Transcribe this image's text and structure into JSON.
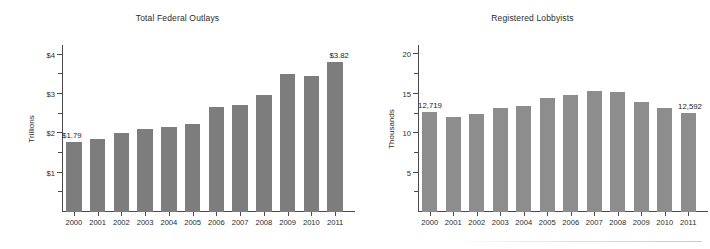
{
  "figure": {
    "background": "#ffffff",
    "panels": [
      "outlays",
      "lobbyists"
    ]
  },
  "chart_data": [
    {
      "id": "outlays",
      "type": "bar",
      "title": "Total Federal Outlays",
      "xlabel": "",
      "ylabel": "Trillions",
      "categories": [
        "2000",
        "2001",
        "2002",
        "2003",
        "2004",
        "2005",
        "2006",
        "2007",
        "2008",
        "2009",
        "2010",
        "2011"
      ],
      "values": [
        1.79,
        1.86,
        2.01,
        2.11,
        2.16,
        2.25,
        2.66,
        2.73,
        2.98,
        3.52,
        3.46,
        3.82
      ],
      "ylim": [
        0,
        4.25
      ],
      "ytick_values": [
        1,
        2,
        3,
        4
      ],
      "ytick_labels": [
        "$1",
        "$2",
        "$3",
        "$4"
      ],
      "yminor_values": [
        0.5,
        1.5,
        2.5,
        3.5
      ],
      "grid": false,
      "legend": false,
      "bar_color": "#7d7d7d",
      "annotations": [
        {
          "category": "2000",
          "label": "$1.79",
          "anchor": "left"
        },
        {
          "category": "2011",
          "label": "$3.82",
          "anchor": "right"
        }
      ]
    },
    {
      "id": "lobbyists",
      "type": "bar",
      "title": "Registered Lobbyists",
      "xlabel": "",
      "ylabel": "Thousands",
      "categories": [
        "2000",
        "2001",
        "2002",
        "2003",
        "2004",
        "2005",
        "2006",
        "2007",
        "2008",
        "2009",
        "2010",
        "2011"
      ],
      "values": [
        12.719,
        12.1,
        12.4,
        13.2,
        13.5,
        14.5,
        14.9,
        15.4,
        15.2,
        14.0,
        13.2,
        12.592
      ],
      "ylim": [
        0,
        21.2
      ],
      "ytick_values": [
        5,
        10,
        15,
        20
      ],
      "ytick_labels": [
        "5",
        "10",
        "15",
        "20"
      ],
      "yminor_values": [
        2.5,
        7.5,
        12.5,
        17.5
      ],
      "grid": false,
      "legend": false,
      "bar_color": "#8d8d8d",
      "annotations": [
        {
          "category": "2000",
          "label": "12,719",
          "anchor": "left"
        },
        {
          "category": "2011",
          "label": "12,592",
          "anchor": "right"
        }
      ]
    }
  ]
}
